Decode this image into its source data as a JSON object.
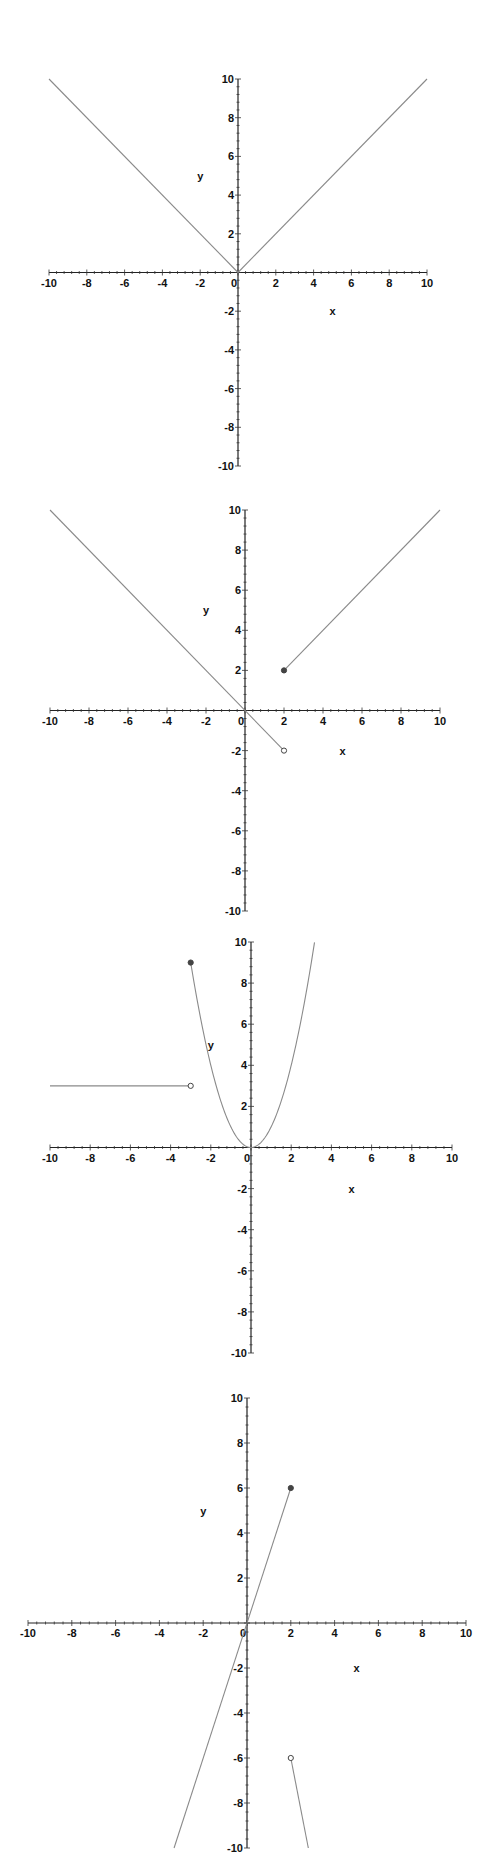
{
  "chart_data": [
    {
      "type": "line",
      "title": "",
      "xlabel": "x",
      "ylabel": "y",
      "xlim": [
        -10,
        10
      ],
      "ylim": [
        -10,
        10
      ],
      "grid": false,
      "x_ticks": [
        -10,
        -8,
        -6,
        -4,
        -2,
        0,
        2,
        4,
        6,
        8,
        10
      ],
      "y_ticks": [
        -10,
        -8,
        -6,
        -4,
        -2,
        2,
        4,
        6,
        8,
        10
      ],
      "series": [
        {
          "name": "y = -x (x < 0)",
          "x": [
            -10,
            0
          ],
          "y": [
            10,
            0
          ]
        },
        {
          "name": "y = x (x >= 0)",
          "x": [
            0,
            10
          ],
          "y": [
            0,
            10
          ]
        }
      ],
      "markers": [],
      "layout": {
        "top": 0,
        "height": 480,
        "x_min_px": 49,
        "x_max_px": 427,
        "y_max_px": 79,
        "y_min_px": 466,
        "xlabel_pos": [
          5,
          -2
        ],
        "ylabel_pos": [
          -2,
          5
        ]
      }
    },
    {
      "type": "line",
      "title": "",
      "xlabel": "x",
      "ylabel": "y",
      "xlim": [
        -10,
        10
      ],
      "ylim": [
        -10,
        10
      ],
      "grid": false,
      "x_ticks": [
        -10,
        -8,
        -6,
        -4,
        -2,
        0,
        2,
        4,
        6,
        8,
        10
      ],
      "y_ticks": [
        -10,
        -8,
        -6,
        -4,
        -2,
        2,
        4,
        6,
        8,
        10
      ],
      "series": [
        {
          "name": "y = -x (x < 2)",
          "x": [
            -10,
            2
          ],
          "y": [
            10,
            -2
          ]
        },
        {
          "name": "y = x (x >= 2)",
          "x": [
            2,
            10
          ],
          "y": [
            2,
            10
          ]
        }
      ],
      "markers": [
        {
          "x": 2,
          "y": 2,
          "filled": true
        },
        {
          "x": 2,
          "y": -2,
          "filled": false
        }
      ],
      "layout": {
        "top": 480,
        "height": 450,
        "x_min_px": 50,
        "x_max_px": 440,
        "y_max_px": 30,
        "y_min_px": 431,
        "xlabel_pos": [
          5,
          -2
        ],
        "ylabel_pos": [
          -2,
          5
        ]
      }
    },
    {
      "type": "line",
      "title": "",
      "xlabel": "x",
      "ylabel": "y",
      "xlim": [
        -10,
        10
      ],
      "ylim": [
        -10,
        10
      ],
      "grid": false,
      "x_ticks": [
        -10,
        -8,
        -6,
        -4,
        -2,
        0,
        2,
        4,
        6,
        8,
        10
      ],
      "y_ticks": [
        -10,
        -8,
        -6,
        -4,
        -2,
        2,
        4,
        6,
        8,
        10
      ],
      "series": [
        {
          "name": "y = 3 (x < -3)",
          "x": [
            -10,
            -3
          ],
          "y": [
            3,
            3
          ]
        },
        {
          "name": "y = x^2 (x >= -3)",
          "function": "x^2",
          "x_range": [
            -3,
            3.16
          ]
        }
      ],
      "markers": [
        {
          "x": -3,
          "y": 9,
          "filled": true
        },
        {
          "x": -3,
          "y": 3,
          "filled": false
        }
      ],
      "layout": {
        "top": 930,
        "height": 460,
        "x_min_px": 50,
        "x_max_px": 452,
        "y_max_px": 12,
        "y_min_px": 423,
        "xlabel_pos": [
          5,
          -2
        ],
        "ylabel_pos": [
          -2,
          5
        ]
      }
    },
    {
      "type": "line",
      "title": "",
      "xlabel": "x",
      "ylabel": "y",
      "xlim": [
        -10,
        10
      ],
      "ylim": [
        -10,
        10
      ],
      "grid": false,
      "x_ticks": [
        -10,
        -8,
        -6,
        -4,
        -2,
        0,
        2,
        4,
        6,
        8,
        10
      ],
      "y_ticks": [
        -10,
        -8,
        -6,
        -4,
        -2,
        2,
        4,
        6,
        8,
        10
      ],
      "series": [
        {
          "name": "y = 3x (x <= 2)",
          "x": [
            -3.33,
            2
          ],
          "y": [
            -10,
            6
          ]
        },
        {
          "name": "y = 4 - 5x (x > 2)",
          "x": [
            2,
            2.8
          ],
          "y": [
            -6,
            -10
          ]
        }
      ],
      "markers": [
        {
          "x": 2,
          "y": 6,
          "filled": true
        },
        {
          "x": 2,
          "y": -6,
          "filled": false
        }
      ],
      "layout": {
        "top": 1390,
        "height": 476,
        "x_min_px": 28,
        "x_max_px": 466,
        "y_max_px": 8,
        "y_min_px": 458,
        "xlabel_pos": [
          5,
          -2
        ],
        "ylabel_pos": [
          -2,
          5
        ]
      }
    }
  ]
}
